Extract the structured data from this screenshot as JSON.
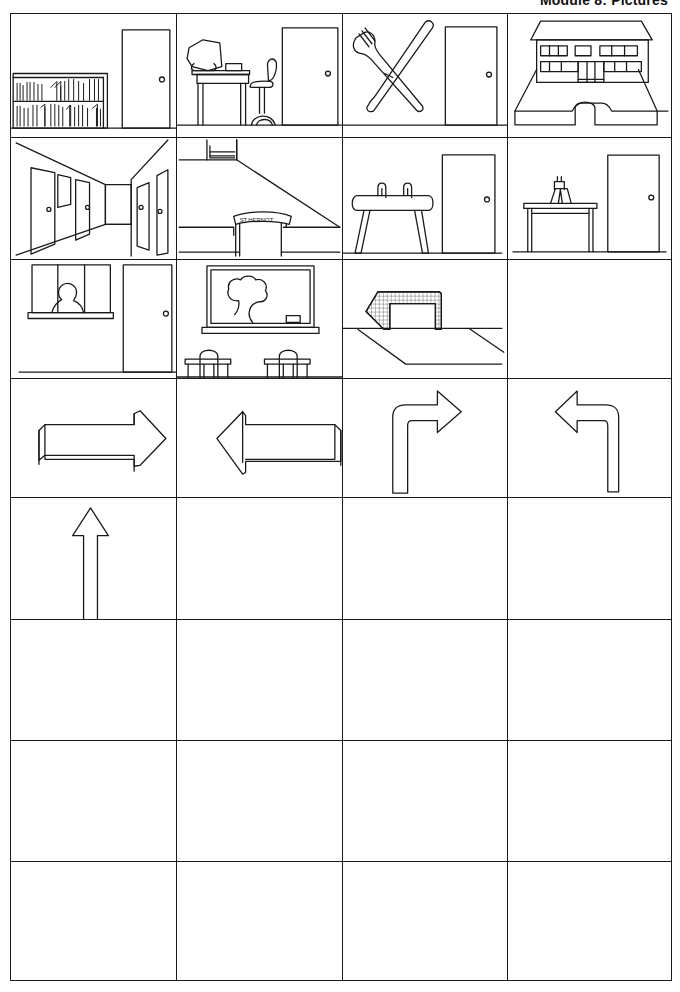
{
  "header": {
    "title": "Module 8: Pictures"
  },
  "grid": {
    "columns": 4,
    "rows": 8,
    "cards": [
      {
        "row": 1,
        "col": 1,
        "name": "library",
        "icon": "bookshelf-with-door-icon"
      },
      {
        "row": 1,
        "col": 2,
        "name": "computer-room",
        "icon": "computer-desk-with-door-icon"
      },
      {
        "row": 1,
        "col": 3,
        "name": "canteen",
        "icon": "fork-and-knife-with-door-icon"
      },
      {
        "row": 1,
        "col": 4,
        "name": "school-building",
        "icon": "school-building-icon"
      },
      {
        "row": 2,
        "col": 1,
        "name": "corridor",
        "icon": "corridor-with-doors-icon"
      },
      {
        "row": 2,
        "col": 2,
        "name": "school-entrance",
        "icon": "entrance-gate-icon",
        "sign_text": "ST.HERNOT"
      },
      {
        "row": 2,
        "col": 3,
        "name": "gym",
        "icon": "pommel-horse-with-door-icon"
      },
      {
        "row": 2,
        "col": 4,
        "name": "science-lab",
        "icon": "lab-table-with-door-icon"
      },
      {
        "row": 3,
        "col": 1,
        "name": "reception",
        "icon": "reception-window-with-door-icon"
      },
      {
        "row": 3,
        "col": 2,
        "name": "classroom",
        "icon": "blackboard-and-desks-icon"
      },
      {
        "row": 3,
        "col": 3,
        "name": "sports-field",
        "icon": "football-goal-icon"
      },
      {
        "row": 3,
        "col": 4,
        "name": "empty",
        "icon": ""
      },
      {
        "row": 4,
        "col": 1,
        "name": "go-right",
        "icon": "arrow-right-icon"
      },
      {
        "row": 4,
        "col": 2,
        "name": "go-left",
        "icon": "arrow-left-icon"
      },
      {
        "row": 4,
        "col": 3,
        "name": "turn-right",
        "icon": "arrow-turn-right-icon"
      },
      {
        "row": 4,
        "col": 4,
        "name": "turn-left",
        "icon": "arrow-turn-left-icon"
      },
      {
        "row": 5,
        "col": 1,
        "name": "go-straight",
        "icon": "arrow-up-icon"
      }
    ],
    "empty_cells_count": 16
  },
  "colors": {
    "line": "#1a1a1a",
    "background": "#ffffff"
  }
}
